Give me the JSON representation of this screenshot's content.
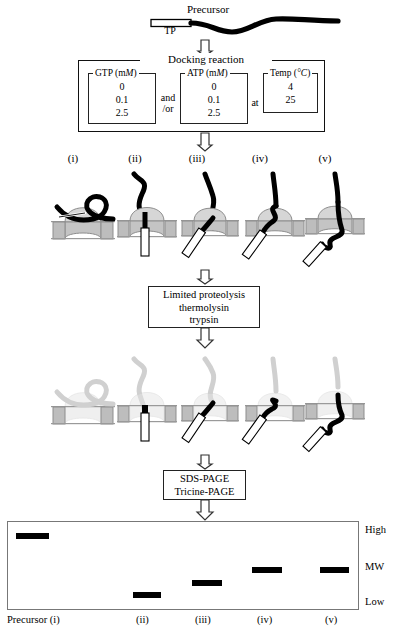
{
  "figure": {
    "precursor_label": "Precursor",
    "tp_label": "TP"
  },
  "docking": {
    "title": "Docking reaction",
    "groups": [
      {
        "name": "gtp",
        "title": "GTP (mM)",
        "title_plain": "GTP (m",
        "title_italic": "M",
        "title_tail": ")",
        "values": [
          "0",
          "0.1",
          "2.5"
        ]
      },
      {
        "name": "atp",
        "title": "ATP (mM)",
        "title_plain": "ATP (m",
        "title_italic": "M",
        "title_tail": ")",
        "values": [
          "0",
          "0.1",
          "2.5"
        ]
      },
      {
        "name": "temp",
        "title": "Temp (°C)",
        "title_plain": "Temp (",
        "title_italic": "°C",
        "title_tail": ")",
        "values": [
          "4",
          "25"
        ]
      }
    ],
    "connector_and": "and",
    "connector_or": "/or",
    "connector_at": "at"
  },
  "panel_labels": [
    "(i)",
    "(ii)",
    "(iii)",
    "(iv)",
    "(v)"
  ],
  "proteolysis": {
    "line1": "Limited proteolysis",
    "line2": "thermolysin",
    "line3": "trypsin"
  },
  "electrophoresis": {
    "line1": "SDS-PAGE",
    "line2": "Tricine-PAGE"
  },
  "gel": {
    "axis_top": "High",
    "axis_mid": "MW",
    "axis_bottom": "Low",
    "lane_labels": [
      "Precursor (i)",
      "(ii)",
      "(iii)",
      "(iv)",
      "(v)"
    ],
    "bands": [
      {
        "lane": "(i)",
        "x": 16,
        "y": 533,
        "width": 33,
        "height": 6
      },
      {
        "lane": "(ii)",
        "x": 133,
        "y": 592,
        "width": 28,
        "height": 6
      },
      {
        "lane": "(iii)",
        "x": 192,
        "y": 580,
        "width": 30,
        "height": 6
      },
      {
        "lane": "(iv)",
        "x": 252,
        "y": 567,
        "width": 30,
        "height": 6
      },
      {
        "lane": "(v)",
        "x": 320,
        "y": 567,
        "width": 29,
        "height": 6
      }
    ]
  },
  "colors": {
    "ink": "#000000",
    "membrane_gray": "#b9b9b9",
    "dome_gray": "#c9c9c9",
    "dome_light": "#dddddd",
    "faded": "#d8d8d8",
    "frame": "#222222",
    "gel_border": "#777777"
  },
  "chart_data": {
    "type": "bar",
    "xlabel": "",
    "ylabel": "MW",
    "categories": [
      "Precursor (i)",
      "(ii)",
      "(iii)",
      "(iv)",
      "(v)"
    ],
    "values": [
      100,
      12,
      26,
      45,
      45
    ],
    "ylim": [
      0,
      100
    ],
    "ytick_labels": [
      "Low",
      "MW",
      "High"
    ],
    "grid": false,
    "legend": "none",
    "note": "Band height encodes apparent molecular weight; higher band = higher MW."
  }
}
